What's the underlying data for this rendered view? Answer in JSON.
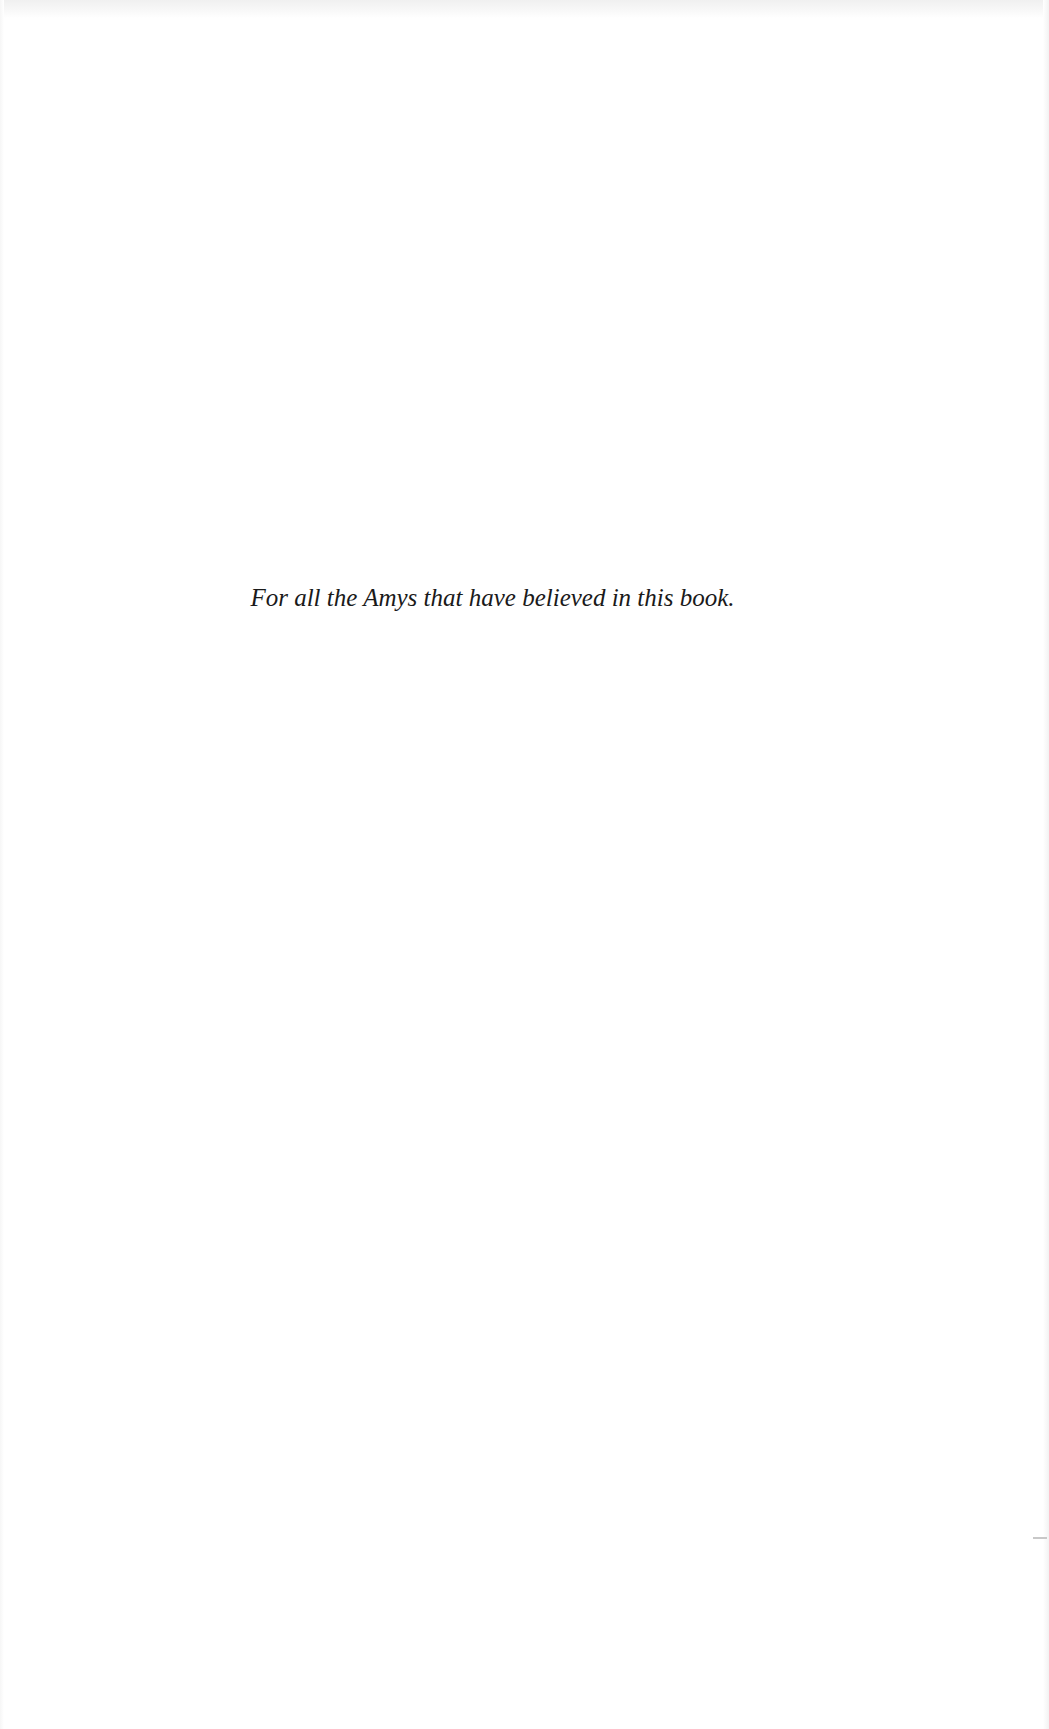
{
  "page": {
    "type": "dedication",
    "dedication_text": "For all the Amys that have believed in this book.",
    "background_color": "#ffffff",
    "text_color": "#1a1a1a"
  }
}
